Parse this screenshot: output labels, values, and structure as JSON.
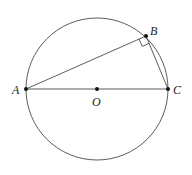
{
  "diagram": {
    "circle": {
      "center_label": "O",
      "cx": 97,
      "cy": 89,
      "r": 71
    },
    "points": [
      {
        "label": "A",
        "x": 26,
        "y": 89
      },
      {
        "label": "B",
        "x": 146,
        "y": 36
      },
      {
        "label": "C",
        "x": 168,
        "y": 89
      },
      {
        "label": "O",
        "x": 97,
        "y": 89
      }
    ],
    "segments": [
      "AB",
      "BC",
      "AC"
    ],
    "right_angle_at": "B",
    "colors": {
      "stroke": "#333333",
      "point": "#111111"
    }
  }
}
